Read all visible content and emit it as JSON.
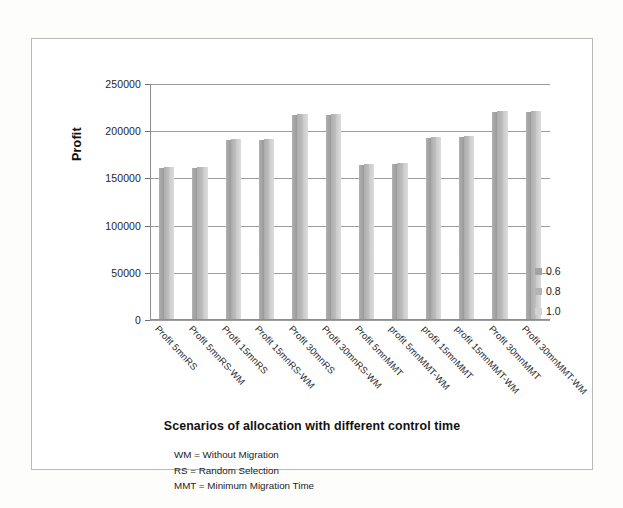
{
  "chart_data": {
    "type": "bar",
    "title": "",
    "xlabel": "Scenarios of allocation with different control time",
    "ylabel": "Profit",
    "ylim": [
      0,
      250000
    ],
    "ytick_labels": [
      "250000",
      "200000",
      "150000",
      "100000",
      "50000",
      "0"
    ],
    "ytick_values": [
      250000,
      200000,
      150000,
      100000,
      50000,
      0
    ],
    "grid": true,
    "legend_position": "right",
    "categories": [
      "Profit 5mnRS",
      "Profit 5mnRS-WM",
      "Profit 15mnRS",
      "Profit 15mnRS-WM",
      "Profit 30mnRS",
      "Profit 30mnRS-WM",
      "Profit 5mnMMT",
      "profit 5mnMMT-WM",
      "profit 15mnMMT",
      "profit 15mnMMT-WM",
      "Profit 30mnMMT",
      "Profit 30mnMMT-WM"
    ],
    "series": [
      {
        "name": "0.6",
        "color": "#a3a3a3",
        "values": [
          161000,
          161000,
          191000,
          191000,
          217000,
          217000,
          164000,
          165000,
          193000,
          194000,
          220000,
          220000
        ]
      },
      {
        "name": "0.8",
        "color": "#b4b4b4",
        "values": [
          162000,
          162000,
          192000,
          192000,
          218000,
          218000,
          165000,
          166000,
          194000,
          195000,
          221000,
          221000
        ]
      },
      {
        "name": "1.0",
        "color": "#d2d2d2",
        "values": [
          162000,
          162000,
          192000,
          192000,
          218000,
          218000,
          165000,
          166000,
          194000,
          195000,
          221000,
          221000
        ]
      }
    ],
    "annotations": [
      "WM = Without Migration",
      "RS = Random Selection",
      "MMT = Minimum Migration Time"
    ]
  }
}
